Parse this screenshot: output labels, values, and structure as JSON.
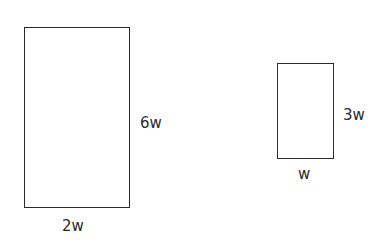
{
  "diagram": {
    "large_rectangle": {
      "height_label": "6w",
      "width_label": "2w"
    },
    "small_rectangle": {
      "height_label": "3w",
      "width_label": "w"
    }
  }
}
